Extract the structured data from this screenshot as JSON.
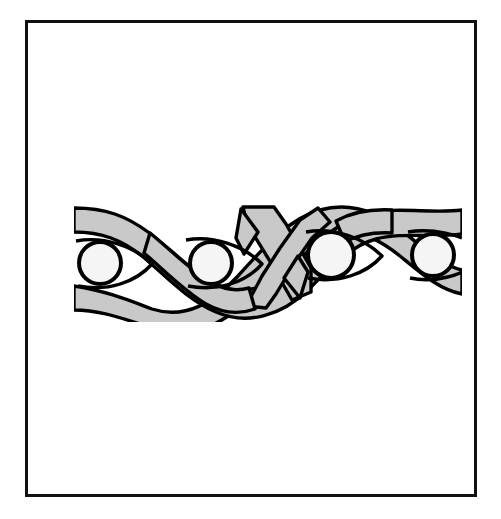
{
  "figure": {
    "kind": "line-drawing-illustration",
    "title": "",
    "caption": "",
    "background_color": "#ffffff"
  },
  "frame": {
    "name": "illustration-border-frame",
    "stroke_color": "#111111",
    "stroke_width": 3,
    "fill_color": "#ffffff",
    "x": 25,
    "y": 20,
    "width": 452,
    "height": 477
  },
  "artwork": {
    "name": "interlace-braid-pattern",
    "band_fill_color": "#c9c9c9",
    "band_outline_color": "#000000",
    "band_outline_width": 3.5,
    "medallion_fill_color": "#f5f5f5",
    "medallion_outline_color": "#000000",
    "medallion_outline_width": 4,
    "band_count": 2,
    "band_width": 24,
    "bounds": {
      "left": 74,
      "right": 462,
      "top": 206,
      "bottom": 312
    },
    "center_y": 259,
    "medallions": [
      {
        "label": "medallion-1",
        "cx": 100,
        "cy": 263,
        "r": 21
      },
      {
        "label": "medallion-2",
        "cx": 211,
        "cy": 263,
        "r": 21
      },
      {
        "label": "medallion-3",
        "cx": 331,
        "cy": 255,
        "r": 23
      },
      {
        "label": "medallion-4",
        "cx": 433,
        "cy": 255,
        "r": 21
      }
    ],
    "center_motif": {
      "label": "angular-cross-motif",
      "x": 240,
      "y": 206,
      "width": 70,
      "height": 100,
      "description": "pointed angular X crossing with chevron terminals"
    }
  }
}
